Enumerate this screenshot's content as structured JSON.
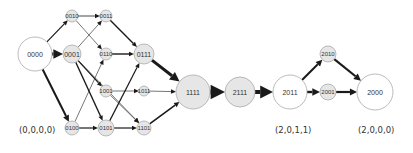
{
  "diagram": {
    "colors": {
      "edge": "#1a1a1a",
      "node_stroke": "#aaaaaa",
      "node_fill_shaded": "#e6e6e6",
      "node_fill_white": "#ffffff",
      "text": "#333333"
    },
    "nodes": [
      {
        "id": "0000",
        "label": "0000",
        "x": 35,
        "y": 54,
        "r": 17,
        "fill": "white"
      },
      {
        "id": "0010",
        "label": "0010",
        "x": 72,
        "y": 16,
        "r": 6,
        "fill": "shaded"
      },
      {
        "id": "0011",
        "label": "0011",
        "x": 106,
        "y": 16,
        "r": 6,
        "fill": "shaded"
      },
      {
        "id": "0001",
        "label": "0001",
        "x": 72,
        "y": 54,
        "r": 9,
        "fill": "shaded"
      },
      {
        "id": "0110",
        "label": "0110",
        "x": 106,
        "y": 54,
        "r": 6,
        "fill": "shaded"
      },
      {
        "id": "0111",
        "label": "0111",
        "x": 144,
        "y": 54,
        "r": 10,
        "fill": "shaded"
      },
      {
        "id": "1001",
        "label": "1001",
        "x": 106,
        "y": 91,
        "r": 6,
        "fill": "shaded"
      },
      {
        "id": "1011",
        "label": "1011",
        "x": 144,
        "y": 91,
        "r": 5,
        "fill": "shaded"
      },
      {
        "id": "0100",
        "label": "0100",
        "x": 72,
        "y": 128,
        "r": 7,
        "fill": "shaded"
      },
      {
        "id": "0101",
        "label": "0101",
        "x": 106,
        "y": 128,
        "r": 8,
        "fill": "shaded"
      },
      {
        "id": "1101",
        "label": "1101",
        "x": 144,
        "y": 128,
        "r": 7,
        "fill": "shaded"
      },
      {
        "id": "1111",
        "label": "1111",
        "x": 193,
        "y": 92,
        "r": 17,
        "fill": "shaded"
      },
      {
        "id": "2111",
        "label": "2111",
        "x": 240,
        "y": 92,
        "r": 15,
        "fill": "shaded"
      },
      {
        "id": "2011",
        "label": "2011",
        "x": 290,
        "y": 92,
        "r": 17,
        "fill": "white"
      },
      {
        "id": "2010",
        "label": "2010",
        "x": 328,
        "y": 54,
        "r": 8,
        "fill": "shaded"
      },
      {
        "id": "2001",
        "label": "2001",
        "x": 328,
        "y": 92,
        "r": 8,
        "fill": "shaded"
      },
      {
        "id": "2000",
        "label": "2000",
        "x": 375,
        "y": 92,
        "r": 18,
        "fill": "white"
      }
    ],
    "edges": [
      {
        "from": "0000",
        "to": "0010",
        "w": 1.2
      },
      {
        "from": "0000",
        "to": "0001",
        "w": 3.0
      },
      {
        "from": "0000",
        "to": "0100",
        "w": 2.0
      },
      {
        "from": "0010",
        "to": "0011",
        "w": 0.8
      },
      {
        "from": "0010",
        "to": "0110",
        "w": 0.6
      },
      {
        "from": "0001",
        "to": "0011",
        "w": 0.6
      },
      {
        "from": "0001",
        "to": "1001",
        "w": 1.2
      },
      {
        "from": "0001",
        "to": "0101",
        "w": 1.4
      },
      {
        "from": "0001",
        "to": "1101",
        "w": 0.6
      },
      {
        "from": "0100",
        "to": "0110",
        "w": 0.6
      },
      {
        "from": "0100",
        "to": "0101",
        "w": 1.2
      },
      {
        "from": "0011",
        "to": "0111",
        "w": 1.4
      },
      {
        "from": "0110",
        "to": "0111",
        "w": 1.4
      },
      {
        "from": "0101",
        "to": "0111",
        "w": 1.2
      },
      {
        "from": "0101",
        "to": "1101",
        "w": 1.2
      },
      {
        "from": "1001",
        "to": "1011",
        "w": 0.6
      },
      {
        "from": "1001",
        "to": "1101",
        "w": 0.6
      },
      {
        "from": "0111",
        "to": "1111",
        "w": 3.0
      },
      {
        "from": "1011",
        "to": "1111",
        "w": 0.6
      },
      {
        "from": "1101",
        "to": "1111",
        "w": 1.6
      },
      {
        "from": "1111",
        "to": "2111",
        "w": 4.5
      },
      {
        "from": "2111",
        "to": "2011",
        "w": 4.0
      },
      {
        "from": "2011",
        "to": "2010",
        "w": 2.0
      },
      {
        "from": "2011",
        "to": "2001",
        "w": 2.4
      },
      {
        "from": "2010",
        "to": "2000",
        "w": 2.2
      },
      {
        "from": "2001",
        "to": "2000",
        "w": 2.2
      }
    ]
  },
  "captions": [
    {
      "id": "caption-0000",
      "text": "(0,0,0,0)",
      "x": 19,
      "y": 125
    },
    {
      "id": "caption-2011",
      "text": "(2,0,1,1)",
      "x": 275,
      "y": 125
    },
    {
      "id": "caption-2000",
      "text": "(2,0,0,0)",
      "x": 358,
      "y": 125
    }
  ]
}
